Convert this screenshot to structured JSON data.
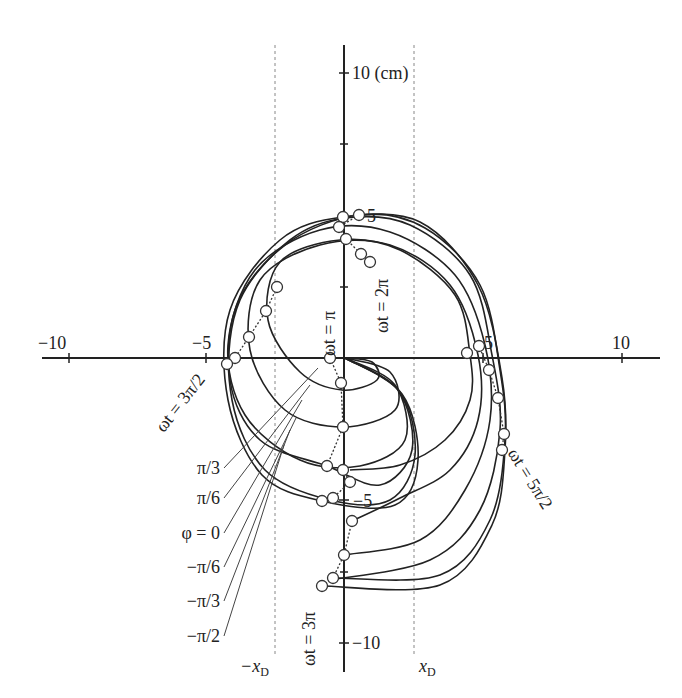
{
  "chart_data": {
    "type": "diagram",
    "title": "",
    "units": "cm",
    "x_axis": {
      "ticks": [
        -10,
        -5,
        5,
        10
      ],
      "labels": [
        "−10",
        "−5",
        "5",
        "10"
      ],
      "range": [
        -10.5,
        11
      ]
    },
    "y_axis": {
      "ticks": [
        10,
        5,
        -5,
        -10
      ],
      "labels": [
        "10 (cm)",
        "5",
        "−5",
        "−10"
      ],
      "range": [
        -11,
        11
      ]
    },
    "dashed_lines": [
      {
        "label": "−x",
        "sub": "D",
        "x": -2.5
      },
      {
        "label": "x",
        "sub": "D",
        "x": 2.5
      }
    ],
    "phase_labels": [
      "π/3",
      "π/6",
      "φ = 0",
      "−π/6",
      "−π/3",
      "−π/2"
    ],
    "time_labels": [
      "ωt = π",
      "ωt = 3π/2",
      "ωt = 2π",
      "ωt = 5π/2",
      "ωt = 3π"
    ],
    "curves": [
      {
        "phi": "π/3",
        "pts": [
          [
            345,
            358
          ],
          [
            372,
            362
          ],
          [
            377,
            380
          ],
          [
            342,
            390
          ],
          [
            300,
            372
          ],
          [
            268,
            320
          ],
          [
            280,
            262
          ],
          [
            340,
            240
          ],
          [
            400,
            250
          ],
          [
            455,
            295
          ],
          [
            470,
            355
          ],
          [
            470,
            400
          ],
          [
            445,
            440
          ],
          [
            400,
            465
          ],
          [
            350,
            470
          ]
        ]
      },
      {
        "phi": "π/6",
        "pts": [
          [
            345,
            358
          ],
          [
            390,
            372
          ],
          [
            395,
            410
          ],
          [
            343,
            427
          ],
          [
            285,
            410
          ],
          [
            250,
            350
          ],
          [
            260,
            280
          ],
          [
            320,
            245
          ],
          [
            390,
            245
          ],
          [
            450,
            285
          ],
          [
            478,
            355
          ],
          [
            478,
            420
          ],
          [
            450,
            470
          ],
          [
            400,
            498
          ],
          [
            352,
            521
          ]
        ]
      },
      {
        "phi": "φ = 0",
        "pts": [
          [
            345,
            358
          ],
          [
            395,
            385
          ],
          [
            405,
            440
          ],
          [
            360,
            466
          ],
          [
            300,
            460
          ],
          [
            245,
            415
          ],
          [
            228,
            345
          ],
          [
            255,
            270
          ],
          [
            320,
            230
          ],
          [
            390,
            232
          ],
          [
            455,
            275
          ],
          [
            485,
            345
          ],
          [
            490,
            420
          ],
          [
            465,
            490
          ],
          [
            420,
            540
          ],
          [
            344,
            555
          ]
        ]
      },
      {
        "phi": "−π/6",
        "pts": [
          [
            345,
            358
          ],
          [
            398,
            390
          ],
          [
            412,
            450
          ],
          [
            380,
            485
          ],
          [
            327,
            466
          ],
          [
            260,
            440
          ],
          [
            230,
            380
          ],
          [
            240,
            300
          ],
          [
            290,
            240
          ],
          [
            345,
            218
          ],
          [
            410,
            225
          ],
          [
            470,
            275
          ],
          [
            492,
            355
          ],
          [
            500,
            430
          ],
          [
            480,
            510
          ],
          [
            430,
            560
          ],
          [
            330,
            580
          ]
        ]
      },
      {
        "phi": "−π/3",
        "pts": [
          [
            345,
            358
          ],
          [
            400,
            392
          ],
          [
            415,
            455
          ],
          [
            390,
            500
          ],
          [
            330,
            500
          ],
          [
            265,
            470
          ],
          [
            232,
            400
          ],
          [
            235,
            310
          ],
          [
            285,
            245
          ],
          [
            359,
            215
          ],
          [
            425,
            228
          ],
          [
            480,
            285
          ],
          [
            500,
            370
          ],
          [
            505,
            440
          ],
          [
            490,
            520
          ],
          [
            440,
            575
          ],
          [
            333,
            578
          ]
        ]
      },
      {
        "phi": "−π/2",
        "pts": [
          [
            345,
            358
          ],
          [
            402,
            394
          ],
          [
            418,
            460
          ],
          [
            395,
            505
          ],
          [
            322,
            501
          ],
          [
            262,
            475
          ],
          [
            228,
            400
          ],
          [
            230,
            310
          ],
          [
            280,
            240
          ],
          [
            343,
            217
          ],
          [
            420,
            222
          ],
          [
            478,
            285
          ],
          [
            502,
            378
          ],
          [
            505,
            450
          ],
          [
            492,
            525
          ],
          [
            440,
            585
          ],
          [
            322,
            586
          ]
        ]
      }
    ],
    "markers": [
      [
        343,
        217
      ],
      [
        359,
        215
      ],
      [
        339,
        227
      ],
      [
        346,
        239
      ],
      [
        361,
        254
      ],
      [
        370,
        262
      ],
      [
        277,
        287
      ],
      [
        266,
        311
      ],
      [
        249,
        337
      ],
      [
        235,
        358
      ],
      [
        227,
        364
      ],
      [
        330,
        358
      ],
      [
        341,
        383
      ],
      [
        343,
        427
      ],
      [
        327,
        466
      ],
      [
        343,
        470
      ],
      [
        350,
        482
      ],
      [
        333,
        498
      ],
      [
        322,
        501
      ],
      [
        352,
        521
      ],
      [
        344,
        555
      ],
      [
        333,
        578
      ],
      [
        322,
        586
      ],
      [
        467,
        353
      ],
      [
        479,
        346
      ],
      [
        489,
        370
      ],
      [
        498,
        398
      ],
      [
        504,
        434
      ],
      [
        502,
        450
      ]
    ]
  }
}
